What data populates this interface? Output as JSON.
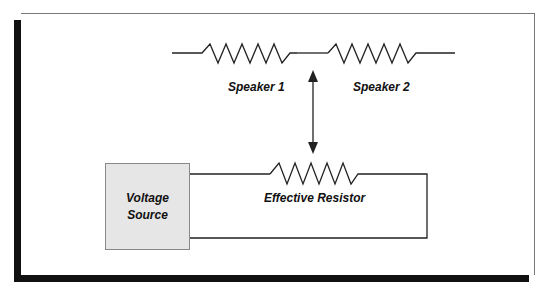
{
  "diagram": {
    "top_circuit": {
      "resistors": [
        {
          "label": "Speaker 1"
        },
        {
          "label": "Speaker 2"
        }
      ]
    },
    "equivalence_arrow": {
      "direction": "bidirectional-vertical"
    },
    "bottom_circuit": {
      "source": {
        "line1": "Voltage",
        "line2": "Source"
      },
      "resistor": {
        "label": "Effective Resistor"
      }
    },
    "colors": {
      "line": "#222222",
      "source_fill": "#e6e6e6",
      "shadow": "#111111"
    }
  }
}
